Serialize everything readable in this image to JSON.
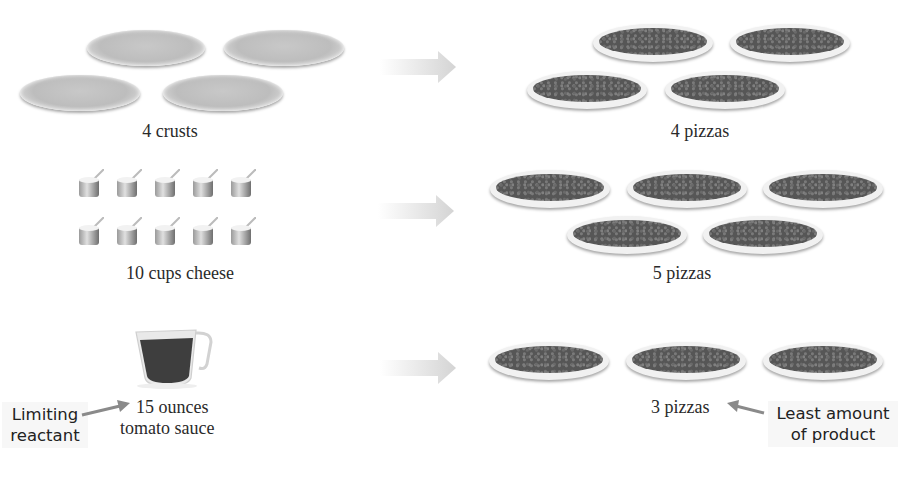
{
  "rows": [
    {
      "reactant_label": "4 crusts",
      "reactant_item": "crust",
      "reactant_count": 4,
      "product_label": "4 pizzas",
      "product_count": 4
    },
    {
      "reactant_label": "10 cups cheese",
      "reactant_item": "cup of cheese",
      "reactant_count": 10,
      "product_label": "5 pizzas",
      "product_count": 5
    },
    {
      "reactant_label_line1": "15 ounces",
      "reactant_label_line2": "tomato sauce",
      "reactant_item": "measuring cup of tomato sauce",
      "reactant_count": 1,
      "product_label": "3 pizzas",
      "product_count": 3
    }
  ],
  "callouts": {
    "limiting_reactant": {
      "line1": "Limiting",
      "line2": "reactant"
    },
    "least_product": {
      "line1": "Least amount",
      "line2": "of product"
    }
  },
  "colors": {
    "arrow": "#d9d9d9",
    "callout_arrow": "#8a8a8a",
    "sauce": "#3a3a3a",
    "crust": "#c4c4c4",
    "topping": "#565656"
  }
}
